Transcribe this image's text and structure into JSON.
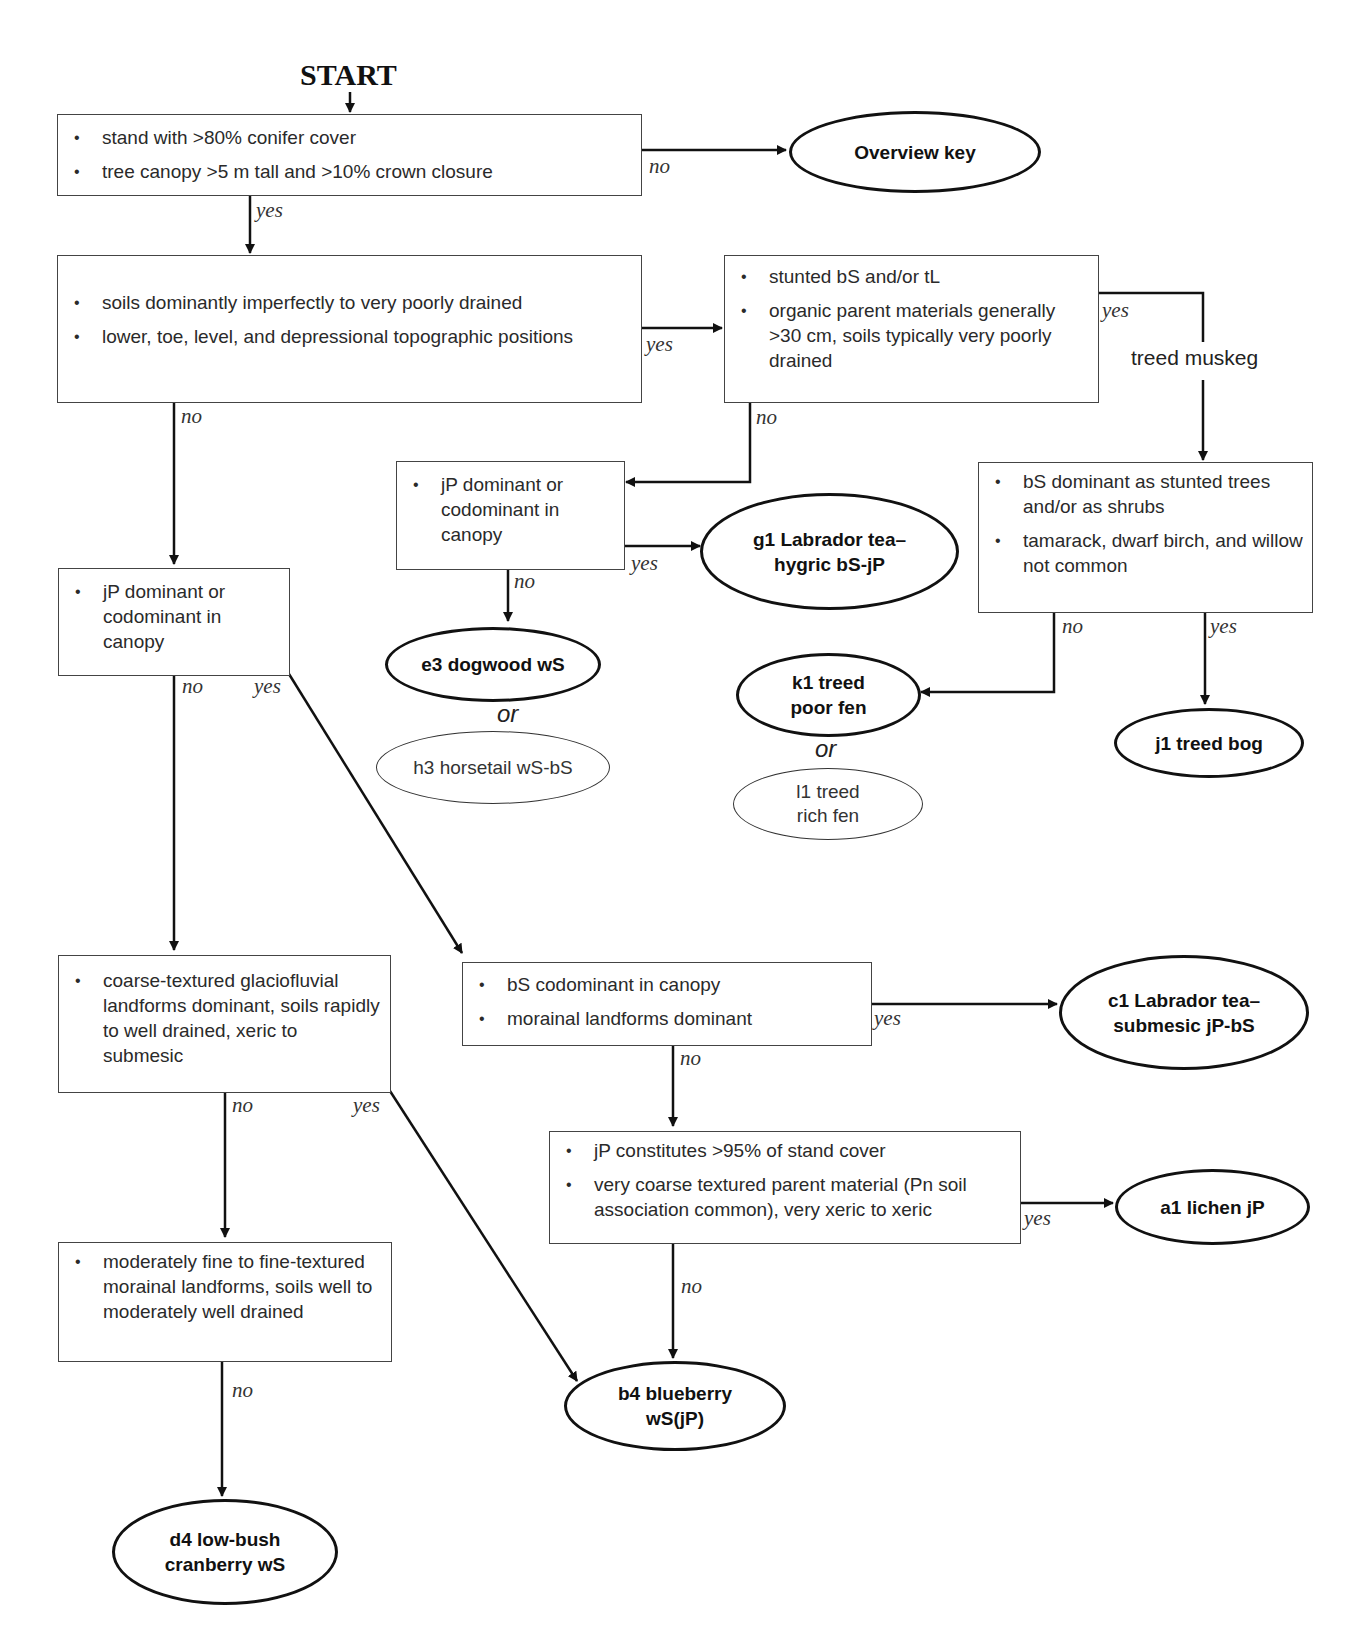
{
  "start_label": "START",
  "decision_boxes": {
    "q1": {
      "bullets": [
        "stand with >80% conifer cover",
        "tree canopy >5 m tall and >10% crown closure"
      ]
    },
    "q2": {
      "bullets": [
        "soils dominantly imperfectly to very poorly drained",
        "lower, toe, level, and depressional topographic positions"
      ]
    },
    "q3": {
      "bullets": [
        "stunted bS and/or tL",
        "organic parent materials generally >30 cm, soils typically very poorly drained"
      ]
    },
    "q4": {
      "bullets": [
        "jP dominant or codominant in canopy"
      ]
    },
    "q5": {
      "bullets": [
        "bS dominant as stunted trees and/or as shrubs",
        "tamarack, dwarf birch, and willow not common"
      ]
    },
    "q6": {
      "bullets": [
        "jP dominant or codominant in canopy"
      ]
    },
    "q7": {
      "bullets": [
        "coarse-textured glaciofluvial landforms dominant, soils rapidly to well drained, xeric to submesic"
      ]
    },
    "q8": {
      "bullets": [
        "bS codominant in canopy",
        "morainal landforms dominant"
      ]
    },
    "q9": {
      "bullets": [
        "jP constitutes >95% of stand cover",
        "very coarse textured parent material (Pn soil association common), very xeric to xeric"
      ]
    },
    "q10": {
      "bullets": [
        "moderately fine to fine-textured morainal landforms, soils well to moderately well drained"
      ]
    }
  },
  "outcomes": {
    "overview": "Overview key",
    "g1": "g1  Labrador tea–\nhygric bS-jP",
    "e3": "e3  dogwood wS",
    "h3": "h3  horsetail wS-bS",
    "k1": "k1  treed\npoor fen",
    "l1": "l1  treed\nrich fen",
    "j1": "j1  treed bog",
    "c1": "c1  Labrador tea–\nsubmesic jP-bS",
    "a1": "a1  lichen jP",
    "b4": "b4  blueberry\nwS(jP)",
    "d4": "d4  low-bush\ncranberry wS"
  },
  "connector_labels": {
    "yes": "yes",
    "no": "no",
    "or": "or",
    "treed_muskeg": "treed muskeg"
  }
}
